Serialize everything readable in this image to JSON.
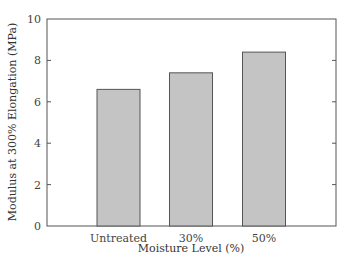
{
  "chart_data": {
    "type": "bar",
    "title": "",
    "xlabel": "Moisture Level (%)",
    "ylabel": "Modulus at 300% Elongation (MPa)",
    "categories": [
      "Untreated",
      "30%",
      "50%"
    ],
    "values": [
      6.6,
      7.4,
      8.4
    ],
    "ylim": [
      0,
      10
    ],
    "yticks": [
      0,
      2,
      4,
      6,
      8,
      10
    ],
    "grid": false,
    "legend": null,
    "bar_color": "#c4c4c4",
    "bar_edge_color": "#555555"
  }
}
